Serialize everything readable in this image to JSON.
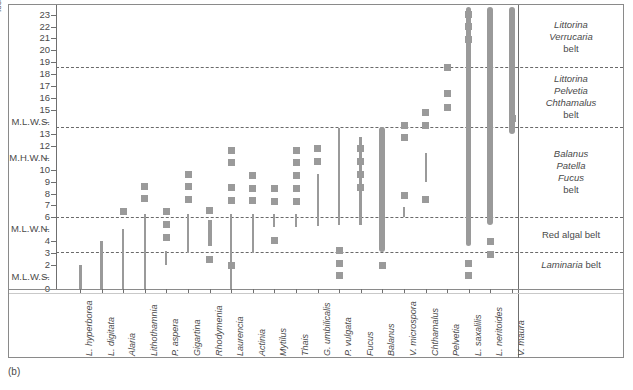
{
  "caption": "(b)",
  "axis": {
    "unit_label": "feet",
    "y_ticks": [
      {
        "v": 0,
        "label": "0"
      },
      {
        "v": 1,
        "label": "M.L.W.S."
      },
      {
        "v": 2,
        "label": "2"
      },
      {
        "v": 3,
        "label": "3"
      },
      {
        "v": 4,
        "label": "4"
      },
      {
        "v": 5,
        "label": "M.L.W.N."
      },
      {
        "v": 6,
        "label": "6"
      },
      {
        "v": 7,
        "label": "7"
      },
      {
        "v": 8,
        "label": "8"
      },
      {
        "v": 9,
        "label": "9"
      },
      {
        "v": 10,
        "label": "10"
      },
      {
        "v": 11,
        "label": "M.H.W.N."
      },
      {
        "v": 12,
        "label": "12"
      },
      {
        "v": 13,
        "label": "13"
      },
      {
        "v": 14,
        "label": "M.L.W.S."
      },
      {
        "v": 15,
        "label": "15"
      },
      {
        "v": 16,
        "label": "16"
      },
      {
        "v": 17,
        "label": "17"
      },
      {
        "v": 18,
        "label": "18"
      },
      {
        "v": 19,
        "label": "19"
      },
      {
        "v": 20,
        "label": "20"
      },
      {
        "v": 21,
        "label": "21"
      },
      {
        "v": 22,
        "label": "22"
      },
      {
        "v": 23,
        "label": "23"
      }
    ],
    "dash_marker_glyph": "–"
  },
  "belts": [
    {
      "name": "Littorina Verrucaria belt",
      "lines": [
        "Littorina",
        "Verrucaria"
      ],
      "tail": "belt",
      "from": 18.6,
      "to": 23.6
    },
    {
      "name": "Littorina Pelvetia Chthamalus belt",
      "lines": [
        "Littorina",
        "Pelvetia",
        "Chthamalus"
      ],
      "tail": "belt",
      "from": 13.6,
      "to": 18.6
    },
    {
      "name": "Balanus Patella Fucus belt",
      "lines": [
        "Balanus",
        "Patella",
        "Fucus"
      ],
      "tail": "belt",
      "from": 6.0,
      "to": 13.6
    },
    {
      "name": "Red algal belt",
      "lines": [],
      "tail": "Red algal belt",
      "from": 3.1,
      "to": 6.0
    },
    {
      "name": "Laminaria belt",
      "lines": [
        "Laminaria"
      ],
      "tail": "belt",
      "from": 0.0,
      "to": 3.1,
      "inline": true
    }
  ],
  "belt_lines": [
    18.6,
    13.6,
    6.0,
    3.1
  ],
  "chart_data": {
    "type": "bar",
    "title": "",
    "subtitle": "",
    "xlabel": "",
    "ylabel": "feet",
    "ylim": [
      0,
      23.6
    ],
    "grid": "dashed horizontal belt boundaries at 3.1, 6.0, 13.6 and 18.6 feet",
    "legend": "none",
    "categories": [
      "L. hyperborea",
      "L. digitata",
      "Alaria",
      "Lithothamnia",
      "P. aspera",
      "Gigartina",
      "Rhodymenia",
      "Laurencia",
      "Actinia",
      "Mytilus",
      "Thais",
      "G. umbilicalis",
      "P. vulgata",
      "Fucus",
      "Balanus",
      "V. microspora",
      "Chthamalus",
      "Pelvetia",
      "L. saxatilis",
      "L. neritoides",
      "V. maura"
    ],
    "series": [
      {
        "name": "L. hyperborea",
        "range": [
          0.0,
          2.0
        ],
        "width": 3,
        "spots": []
      },
      {
        "name": "L. digitata",
        "range": [
          0.0,
          4.0
        ],
        "width": 3,
        "spots": []
      },
      {
        "name": "Alaria",
        "range": [
          0.0,
          5.0
        ],
        "width": 2,
        "spots": [
          6.5
        ]
      },
      {
        "name": "Lithothamnia",
        "range": [
          0.0,
          6.3
        ],
        "width": 2,
        "spots": [
          7.6,
          8.6
        ]
      },
      {
        "name": "P. aspera",
        "range": [
          2.0,
          3.2
        ],
        "width": 2,
        "spots": [
          4.3,
          5.4,
          6.5
        ]
      },
      {
        "name": "Gigartina",
        "range": [
          3.0,
          6.3
        ],
        "width": 2,
        "spots": [
          7.5,
          8.6,
          9.6
        ]
      },
      {
        "name": "Rhodymenia",
        "range": [
          3.6,
          5.8
        ],
        "width": 4,
        "spots": [
          2.5,
          6.6
        ]
      },
      {
        "name": "Laurencia",
        "range": [
          0.0,
          6.3
        ],
        "width": 2,
        "spots": [
          2.0,
          7.4,
          8.5,
          10.6,
          11.6
        ]
      },
      {
        "name": "Actinia",
        "range": [
          3.0,
          6.3
        ],
        "width": 2,
        "spots": [
          7.4,
          8.4,
          9.5
        ]
      },
      {
        "name": "Mytilus",
        "range": [
          5.2,
          6.3
        ],
        "width": 2,
        "spots": [
          4.1,
          7.3,
          8.4
        ]
      },
      {
        "name": "Thais",
        "range": [
          5.2,
          6.3
        ],
        "width": 2,
        "spots": [
          7.3,
          8.4,
          9.5,
          10.6,
          11.6
        ]
      },
      {
        "name": "G. umbilicalis",
        "range": [
          5.3,
          9.6
        ],
        "width": 2,
        "spots": [
          10.7,
          11.8
        ]
      },
      {
        "name": "P. vulgata",
        "range": [
          5.4,
          13.5
        ],
        "width": 2,
        "spots": [
          3.2,
          2.1,
          1.1
        ]
      },
      {
        "name": "Fucus",
        "range": [
          5.4,
          12.7
        ],
        "width": 3,
        "spots": [
          8.5,
          9.6,
          10.7,
          11.8
        ]
      },
      {
        "name": "Balanus",
        "range": [
          3.1,
          13.6
        ],
        "width": 6,
        "spots": [
          2.0
        ]
      },
      {
        "name": "V. microspora",
        "range": [
          6.0,
          6.9
        ],
        "width": 2,
        "spots": [
          7.8,
          12.7,
          13.7
        ]
      },
      {
        "name": "Chthamalus",
        "range": [
          9.0,
          11.4
        ],
        "width": 2,
        "spots": [
          7.5,
          13.7,
          14.8
        ]
      },
      {
        "name": "Pelvetia",
        "range": [
          18.6,
          18.6
        ],
        "width": 2,
        "spots": [
          15.2,
          16.4,
          18.6
        ]
      },
      {
        "name": "L. saxalilis",
        "range": [
          3.6,
          23.6
        ],
        "width": 5,
        "spots": [
          2.1,
          1.1,
          20.9,
          22.0,
          23.0
        ]
      },
      {
        "name": "L. neritoides",
        "range": [
          5.4,
          23.6
        ],
        "width": 6,
        "spots": [
          4.0,
          2.9
        ]
      },
      {
        "name": "V. maura",
        "range": [
          13.0,
          23.6
        ],
        "width": 6,
        "spots": [
          14.3
        ]
      }
    ]
  },
  "species_labels": [
    "L. hyperborea",
    "L. digitata",
    "Alaria",
    "Lithothamnia",
    "P. aspera",
    "Gigartina",
    "Rhodymenia",
    "Laurencia",
    "Actinia",
    "Mytilus",
    "Thais",
    "G. umbilicalis",
    "P. vulgata",
    "Fucus",
    "Balanus",
    "V. microspora",
    "Chthamalus",
    "Pelvetia",
    "L. saxalilis",
    "L. neritoides",
    "V. maura"
  ]
}
